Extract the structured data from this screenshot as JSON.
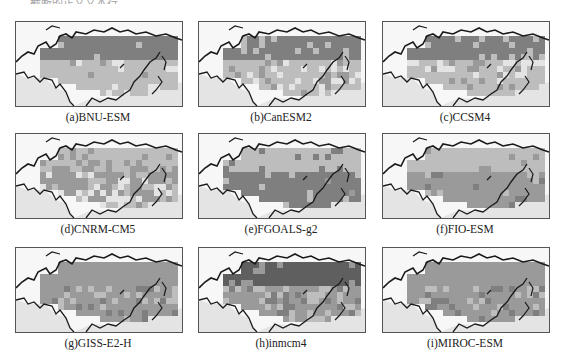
{
  "top_text_fragment": "— 截断的正文文本行 —",
  "colors": {
    "ocean": "#f7f7f7",
    "land_low": "#e4e4e4",
    "mid": "#bdbdbd",
    "high": "#9a9a9a",
    "very_high": "#7f7f7f",
    "max": "#5f5f5f",
    "coast": "#1a1a1a",
    "frame": "#555555"
  },
  "chart_data": {
    "type": "heatmap",
    "title": "",
    "legend": [],
    "panels": [
      {
        "id": "a",
        "label": "(a)BNU-ESM",
        "pattern": "uniform dark over northern Eurasia, lighter mottled band toward south"
      },
      {
        "id": "b",
        "label": "(b)CanESM2",
        "pattern": "uniform dark north, mottled checker band along 40–55°N"
      },
      {
        "id": "c",
        "label": "(c)CCSM4",
        "pattern": "uniform dark north, mottled band across central Asia"
      },
      {
        "id": "d",
        "label": "(d)CNRM-CM5",
        "pattern": "medium gray, heavily mottled throughout"
      },
      {
        "id": "e",
        "label": "(e)FGOALS-g2",
        "pattern": "lighter medium gray north, darker band along ~45°N"
      },
      {
        "id": "f",
        "label": "(f)FIO-ESM",
        "pattern": "light-medium gray north, darker band along southern boundary"
      },
      {
        "id": "g",
        "label": "(g)GISS-E2-H",
        "pattern": "medium gray, mottled, darker patches in China"
      },
      {
        "id": "h",
        "label": "(h)inmcm4",
        "pattern": "very dark over central Siberia, medium gray elsewhere"
      },
      {
        "id": "i",
        "label": "(i)MIROC-ESM",
        "pattern": "medium gray, mottled, darker patches in east Asia"
      }
    ]
  }
}
